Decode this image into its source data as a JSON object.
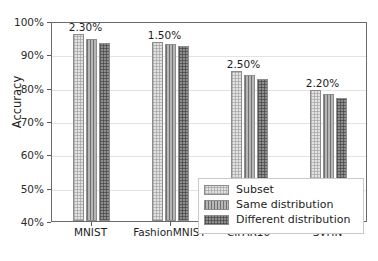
{
  "chart_data": {
    "type": "bar",
    "title": "",
    "xlabel": "",
    "ylabel": "Accuracy",
    "categories": [
      "MNIST",
      "FashionMNIST",
      "CIFAR10",
      "SVHN"
    ],
    "ylim": [
      40,
      100
    ],
    "ytick_labels": [
      "40%",
      "50%",
      "60%",
      "70%",
      "80%",
      "90%",
      "100%"
    ],
    "ytick_values": [
      40,
      50,
      60,
      70,
      80,
      90,
      100
    ],
    "grid": true,
    "legend_position": "lower right",
    "series": [
      {
        "name": "Subset",
        "values": [
          96.0,
          93.8,
          85.0,
          79.2
        ],
        "color": "#e2e2e2",
        "hatch": "cross-dots"
      },
      {
        "name": "Same distribution",
        "values": [
          94.5,
          93.0,
          83.8,
          78.0
        ],
        "color": "#b6b6b6",
        "hatch": "vertical-lines"
      },
      {
        "name": "Different distribution",
        "values": [
          93.5,
          92.6,
          82.5,
          76.9
        ],
        "color": "#8e8e8e",
        "hatch": "dense-cross"
      }
    ],
    "annotations": [
      {
        "group": "MNIST",
        "text": "2.30%"
      },
      {
        "group": "FashionMNIST",
        "text": "1.50%"
      },
      {
        "group": "CIFAR10",
        "text": "2.50%"
      },
      {
        "group": "SVHN",
        "text": "2.20%"
      }
    ]
  }
}
